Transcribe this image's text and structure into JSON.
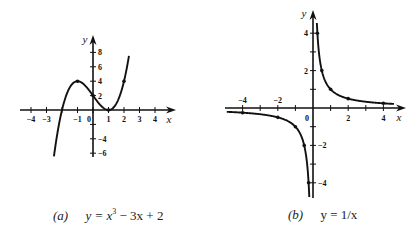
{
  "chart_data": [
    {
      "id": "a",
      "type": "line",
      "title": "y = x^3 - 3x + 2",
      "caption_tag": "(a)",
      "caption_eq": "y = x³ − 3x + 2",
      "function": "x^3 - 3x + 2",
      "xlabel": "x",
      "ylabel": "y",
      "x_ticks": [
        -4,
        -3,
        -2,
        -1,
        0,
        1,
        2,
        3,
        4
      ],
      "x_tick_labels": [
        "−4",
        "−3",
        "−1",
        "0",
        "1",
        "2",
        "3",
        "4"
      ],
      "x_tick_label_values": [
        -4,
        -3,
        -1,
        0,
        1,
        2,
        3,
        4
      ],
      "y_ticks": [
        -6,
        -4,
        -2,
        2,
        4,
        6,
        8
      ],
      "y_tick_labels": [
        "8",
        "6",
        "4",
        "2",
        "−4",
        "−6"
      ],
      "y_tick_label_values": [
        8,
        6,
        4,
        2,
        -4,
        -6
      ],
      "xlim": [
        -4.2,
        5.2
      ],
      "ylim": [
        -6.5,
        10.5
      ],
      "grid": false,
      "curve_x_range": [
        -2.52,
        2.32
      ],
      "marked_points": [
        {
          "x": -1,
          "y": 4
        },
        {
          "x": 0,
          "y": 2
        },
        {
          "x": 1,
          "y": 0
        },
        {
          "x": 2,
          "y": 4
        }
      ],
      "layout": {
        "origin_px": [
          93,
          110
        ],
        "px_per_x": 15.5,
        "px_per_y": 7.2,
        "x_axis_px": [
          20,
          176
        ],
        "y_axis_px": [
          35,
          157
        ]
      }
    },
    {
      "id": "b",
      "type": "line",
      "title": "y = 1/x",
      "caption_tag": "(b)",
      "caption_eq": "y = 1/x",
      "function": "1/x",
      "xlabel": "x",
      "ylabel": "y",
      "x_ticks": [
        -4,
        -3,
        -2,
        -1,
        1,
        2,
        3,
        4
      ],
      "x_tick_labels": [
        "−4",
        "−2",
        "0",
        "2",
        "4"
      ],
      "x_tick_label_values": [
        -4,
        -2,
        0,
        2,
        4
      ],
      "y_ticks": [
        -4,
        -3,
        -2,
        -1,
        1,
        2,
        3,
        4
      ],
      "y_tick_labels": [
        "4",
        "2",
        "−2",
        "−4"
      ],
      "y_tick_label_values": [
        4,
        2,
        -2,
        -4
      ],
      "xlim": [
        -4.8,
        5.2
      ],
      "ylim": [
        -4.8,
        5.2
      ],
      "grid": false,
      "curve_x_range_positive": [
        0.22,
        4.6
      ],
      "curve_x_range_negative": [
        -4.9,
        -0.21
      ],
      "marked_points": [
        {
          "x": 0.25,
          "y": 4
        },
        {
          "x": 0.5,
          "y": 2
        },
        {
          "x": 1,
          "y": 1
        },
        {
          "x": 2,
          "y": 0.5
        },
        {
          "x": 4,
          "y": 0.25
        },
        {
          "x": -4,
          "y": -0.25
        },
        {
          "x": -2,
          "y": -0.5
        },
        {
          "x": -1,
          "y": -1
        },
        {
          "x": -0.5,
          "y": -2
        },
        {
          "x": -0.25,
          "y": -4
        }
      ],
      "layout": {
        "origin_px": [
          313,
          108
        ],
        "px_per_x": 17.6,
        "px_per_y": 18.7,
        "x_axis_px": [
          225,
          406
        ],
        "y_axis_px": [
          10,
          198
        ]
      }
    }
  ],
  "captions": {
    "a": {
      "tag": "(a)",
      "eq_prefix": "y = x",
      "eq_exp": "3",
      "eq_suffix": " − 3x + 2"
    },
    "b": {
      "tag": "(b)",
      "eq": "y = 1/x"
    }
  },
  "colors": {
    "ink": "#111111",
    "background": "#ffffff"
  }
}
